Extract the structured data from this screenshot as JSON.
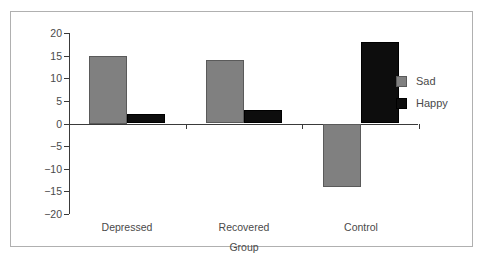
{
  "chart_data": {
    "type": "bar",
    "title": "",
    "subtitle": "",
    "xlabel": "Group",
    "ylabel": "",
    "categories": [
      "Depressed",
      "Recovered",
      "Control"
    ],
    "series": [
      {
        "name": "Sad",
        "color": "#808080",
        "values": [
          15,
          14,
          -14
        ]
      },
      {
        "name": "Happy",
        "color": "#0d0d0d",
        "values": [
          2,
          3,
          18
        ]
      }
    ],
    "ylim": [
      -20,
      20
    ],
    "yticks": [
      20,
      15,
      10,
      5,
      0,
      -5,
      -10,
      -15,
      -20
    ],
    "ytick_labels": [
      "20",
      "15",
      "10",
      "5",
      "0",
      "−5",
      "−10",
      "−15",
      "−20"
    ],
    "grid": false,
    "legend_position": "right",
    "legend_entries": [
      "Sad",
      "Happy"
    ],
    "zero_line": true
  }
}
